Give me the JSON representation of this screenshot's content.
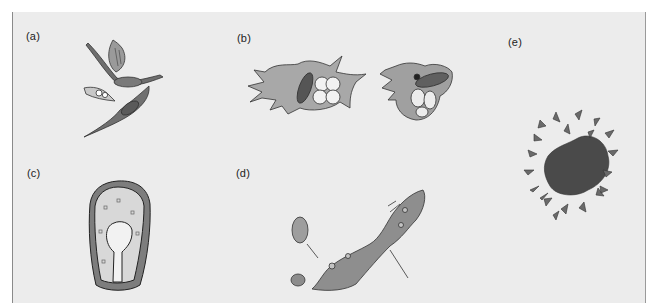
{
  "figure": {
    "background_color": "#ececec",
    "ink_color": "#3a3a3a",
    "panels": [
      {
        "id": "a",
        "label": "(a)",
        "subject": "spindle-shaped flagellated cells"
      },
      {
        "id": "b",
        "label": "(b)",
        "subject": "amoeboid cells with pseudopodia engulfing prey"
      },
      {
        "id": "c",
        "label": "(c)",
        "subject": "ovoid cell with central invaginated cavity"
      },
      {
        "id": "d",
        "label": "(d)",
        "subject": "elongated plasmodial cell with attached cells"
      },
      {
        "id": "e",
        "label": "(e)",
        "subject": "cluster of cells surrounded by stellate cells"
      }
    ]
  }
}
